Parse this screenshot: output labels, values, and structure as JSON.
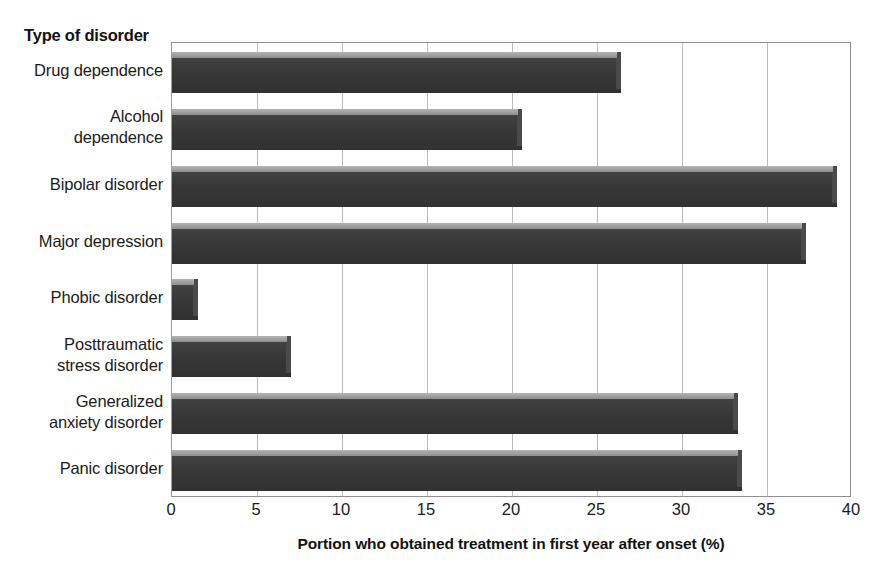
{
  "chart_data": {
    "type": "bar",
    "orientation": "horizontal",
    "title": "",
    "xlabel": "Portion who obtained treatment in first year after onset (%)",
    "ylabel": "Type of disorder",
    "categories": [
      "Drug dependence",
      "Alcohol\ndependence",
      "Bipolar disorder",
      "Major depression",
      "Phobic disorder",
      "Posttraumatic\nstress disorder",
      "Generalized\nanxiety disorder",
      "Panic disorder"
    ],
    "values": [
      26.4,
      20.6,
      39.1,
      37.3,
      1.5,
      7.0,
      33.3,
      33.5
    ],
    "xlim": [
      0,
      40
    ],
    "xticks": [
      0,
      5,
      10,
      15,
      20,
      25,
      30,
      35,
      40
    ],
    "xtick_labels": [
      "0",
      "5",
      "10",
      "15",
      "20",
      "25",
      "30",
      "35",
      "40"
    ],
    "grid": "vertical",
    "legend": "none",
    "bar_color": "#3a3a3a",
    "bar_highlight_color": "#9d9d9d",
    "gridline_color": "#bdbdbd",
    "plot_border_color": "#8f8f8f",
    "background_color": "#ffffff"
  }
}
